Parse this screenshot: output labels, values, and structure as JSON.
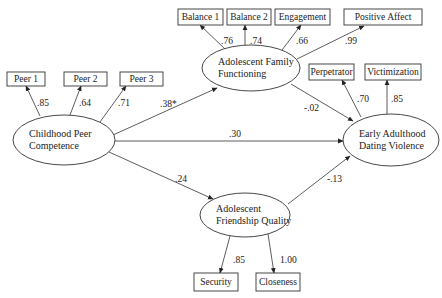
{
  "diagram": {
    "type": "structural-equation-model",
    "latent_nodes": [
      {
        "id": "peer",
        "label_lines": [
          "Childhood Peer",
          "Competence"
        ],
        "cx": 64,
        "cy": 140,
        "rx": 51,
        "ry": 25
      },
      {
        "id": "family",
        "label_lines": [
          "Adolescent Family",
          "Functioning"
        ],
        "cx": 251,
        "cy": 68,
        "rx": 49,
        "ry": 23
      },
      {
        "id": "dating",
        "label_lines": [
          "Early Adulthood",
          "Dating Violence"
        ],
        "cx": 391,
        "cy": 140,
        "rx": 48,
        "ry": 26
      },
      {
        "id": "friend",
        "label_lines": [
          "Adolescent",
          "Friendship Quality"
        ],
        "cx": 245,
        "cy": 215,
        "rx": 45,
        "ry": 22
      }
    ],
    "indicators": [
      {
        "id": "peer1",
        "label": "Peer 1",
        "x": 7,
        "y": 72,
        "w": 38,
        "h": 14
      },
      {
        "id": "peer2",
        "label": "Peer 2",
        "x": 64,
        "y": 72,
        "w": 43,
        "h": 14
      },
      {
        "id": "peer3",
        "label": "Peer 3",
        "x": 120,
        "y": 72,
        "w": 43,
        "h": 14
      },
      {
        "id": "balance1",
        "label": "Balance 1",
        "x": 178,
        "y": 9,
        "w": 45,
        "h": 16
      },
      {
        "id": "balance2",
        "label": "Balance 2",
        "x": 227,
        "y": 9,
        "w": 44,
        "h": 16
      },
      {
        "id": "engagement",
        "label": "Engagement",
        "x": 275,
        "y": 9,
        "w": 55,
        "h": 16
      },
      {
        "id": "posaffect",
        "label": "Positive Affect",
        "x": 344,
        "y": 9,
        "w": 78,
        "h": 16
      },
      {
        "id": "perpetrator",
        "label": "Perpetrator",
        "x": 309,
        "y": 64,
        "w": 45,
        "h": 16
      },
      {
        "id": "victimization",
        "label": "Victimization",
        "x": 365,
        "y": 64,
        "w": 56,
        "h": 16
      },
      {
        "id": "security",
        "label": "Security",
        "x": 194,
        "y": 273,
        "w": 44,
        "h": 18
      },
      {
        "id": "closeness",
        "label": "Closeness",
        "x": 256,
        "y": 273,
        "w": 44,
        "h": 18
      }
    ],
    "loadings": [
      {
        "from": [
          40,
          116
        ],
        "to": [
          26,
          86
        ],
        "value": ".85",
        "lx": 37,
        "ly": 106
      },
      {
        "from": [
          70,
          115
        ],
        "to": [
          81,
          86
        ],
        "value": ".64",
        "lx": 79,
        "ly": 106
      },
      {
        "from": [
          100,
          122
        ],
        "to": [
          126,
          86
        ],
        "value": ".71",
        "lx": 118,
        "ly": 106
      },
      {
        "from": [
          225,
          49
        ],
        "to": [
          200,
          25
        ],
        "value": ".76",
        "lx": 221,
        "ly": 44
      },
      {
        "from": [
          245,
          45
        ],
        "to": [
          245,
          25
        ],
        "value": ".74",
        "lx": 250,
        "ly": 44
      },
      {
        "from": [
          282,
          50
        ],
        "to": [
          301,
          25
        ],
        "value": ".66",
        "lx": 296,
        "ly": 44
      },
      {
        "from": [
          297,
          59
        ],
        "to": [
          364,
          26
        ],
        "value": ".99",
        "lx": 345,
        "ly": 44
      },
      {
        "from": [
          361,
          117
        ],
        "to": [
          342,
          80
        ],
        "value": ".70",
        "lx": 357,
        "ly": 102
      },
      {
        "from": [
          387,
          114
        ],
        "to": [
          387,
          80
        ],
        "value": ".85",
        "lx": 391,
        "ly": 102
      },
      {
        "from": [
          230,
          236
        ],
        "to": [
          220,
          273
        ],
        "value": ".85",
        "lx": 233,
        "ly": 263
      },
      {
        "from": [
          268,
          234
        ],
        "to": [
          274,
          273
        ],
        "value": "1.00",
        "lx": 280,
        "ly": 263
      }
    ],
    "paths": [
      {
        "from": [
          113,
          135
        ],
        "to": [
          217,
          88
        ],
        "value": ".38*",
        "lx": 160,
        "ly": 107
      },
      {
        "from": [
          115,
          141
        ],
        "to": [
          343,
          141
        ],
        "value": ".30",
        "lx": 229,
        "ly": 137
      },
      {
        "from": [
          109,
          152
        ],
        "to": [
          213,
          199
        ],
        "value": ".24",
        "lx": 175,
        "ly": 182
      },
      {
        "from": [
          291,
          84
        ],
        "to": [
          353,
          121
        ],
        "value": "-.02",
        "lx": 304,
        "ly": 111
      },
      {
        "from": [
          288,
          204
        ],
        "to": [
          350,
          156
        ],
        "value": "-.13",
        "lx": 327,
        "ly": 182
      }
    ]
  }
}
